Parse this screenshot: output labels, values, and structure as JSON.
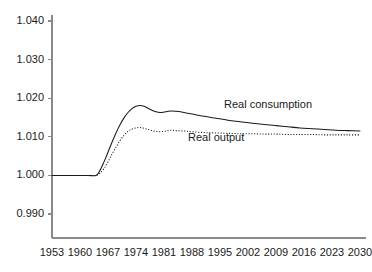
{
  "chart_data": {
    "type": "line",
    "title": "",
    "subtitle": "",
    "xlabel": "",
    "ylabel": "",
    "xlim": [
      1953,
      2030
    ],
    "ylim": [
      0.9855,
      1.0425
    ],
    "grid": false,
    "legend_position": "inline-annotation",
    "x_tick_labels": [
      "1953",
      "1960",
      "1967",
      "1974",
      "1981",
      "1988",
      "1995",
      "2002",
      "2009",
      "2016",
      "2023",
      "2030"
    ],
    "x_ticks": [
      1953,
      1960,
      1967,
      1974,
      1981,
      1988,
      1995,
      2002,
      2009,
      2016,
      2023,
      2030
    ],
    "y_tick_labels": [
      "0.990",
      "1.000",
      "1.010",
      "1.020",
      "1.030",
      "1.040"
    ],
    "y_ticks": [
      0.99,
      1.0,
      1.01,
      1.02,
      1.03,
      1.04
    ],
    "annotations": [
      {
        "text": "Real consumption",
        "x": 1996,
        "y": 1.0181
      },
      {
        "text": "Real output",
        "x": 1987,
        "y": 1.0096
      }
    ],
    "series": [
      {
        "name": "Real consumption",
        "style": "solid",
        "color": "#1a1a1a",
        "x": [
          1953,
          1956,
          1959,
          1962,
          1964,
          1965,
          1966,
          1967,
          1968,
          1969,
          1970,
          1971,
          1972,
          1973,
          1974,
          1975,
          1976,
          1977,
          1978,
          1979,
          1980,
          1981,
          1982,
          1983,
          1984,
          1986,
          1988,
          1991,
          1994,
          1997,
          2000,
          2003,
          2006,
          2009,
          2012,
          2015,
          2018,
          2021,
          2024,
          2027,
          2030
        ],
        "values": [
          1.0,
          1.0,
          1.0,
          1.0,
          1.0,
          1.0013,
          1.0035,
          1.006,
          1.0086,
          1.011,
          1.0131,
          1.0149,
          1.0163,
          1.0173,
          1.0179,
          1.0181,
          1.0179,
          1.0174,
          1.0169,
          1.0165,
          1.0163,
          1.0164,
          1.0166,
          1.0167,
          1.0166,
          1.0163,
          1.0159,
          1.0153,
          1.0148,
          1.0143,
          1.0139,
          1.0135,
          1.0132,
          1.0129,
          1.0126,
          1.0123,
          1.0121,
          1.0119,
          1.0117,
          1.0116,
          1.0115
        ]
      },
      {
        "name": "Real output",
        "style": "dotted",
        "color": "#1a1a1a",
        "x": [
          1953,
          1956,
          1959,
          1962,
          1964,
          1965,
          1966,
          1967,
          1968,
          1969,
          1970,
          1971,
          1972,
          1973,
          1974,
          1975,
          1976,
          1977,
          1978,
          1979,
          1980,
          1981,
          1982,
          1983,
          1984,
          1986,
          1988,
          1991,
          1994,
          1997,
          2000,
          2003,
          2006,
          2009,
          2012,
          2015,
          2018,
          2021,
          2024,
          2027,
          2030
        ],
        "values": [
          1.0,
          1.0,
          1.0,
          1.0,
          1.0,
          1.0006,
          1.0018,
          1.0035,
          1.0055,
          1.0073,
          1.009,
          1.0104,
          1.0114,
          1.012,
          1.0123,
          1.0124,
          1.0122,
          1.0119,
          1.0116,
          1.0114,
          1.0113,
          1.0114,
          1.0116,
          1.0117,
          1.0116,
          1.0115,
          1.0113,
          1.0111,
          1.011,
          1.0109,
          1.0108,
          1.0108,
          1.0107,
          1.0107,
          1.0106,
          1.0106,
          1.0106,
          1.0105,
          1.0105,
          1.0105,
          1.0105
        ]
      }
    ]
  },
  "figure": {
    "background_color": "#ffffff",
    "axis_color": "#8a8a8a",
    "line_color": "#1a1a1a"
  }
}
